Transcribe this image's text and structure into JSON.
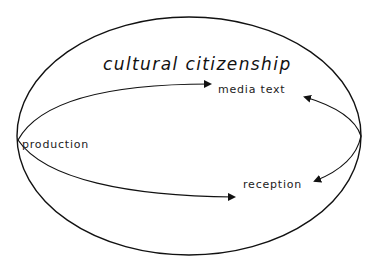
{
  "diagram": {
    "title": "cultural citizenship",
    "nodes": {
      "production": "production",
      "media_text": "media text",
      "reception": "reception"
    },
    "edges": [
      {
        "from": "production",
        "to": "media text"
      },
      {
        "from": "production",
        "to": "reception"
      },
      {
        "from": "media text",
        "to": "reception",
        "bidirectional": true
      }
    ],
    "colors": {
      "stroke": "#111111",
      "background": "#ffffff"
    }
  }
}
